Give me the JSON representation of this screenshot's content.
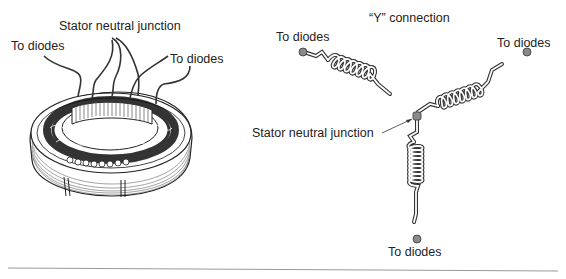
{
  "left_figure": {
    "name": "stator-assembly",
    "labels": {
      "neutral": "Stator neutral junction",
      "diodes_left": "To diodes",
      "diodes_right": "To diodes"
    }
  },
  "right_figure": {
    "name": "y-connection-schematic",
    "title": "“Y” connection",
    "labels": {
      "diodes_top_left": "To diodes",
      "diodes_top_right": "To diodes",
      "diodes_bottom": "To diodes",
      "neutral": "Stator neutral junction"
    }
  },
  "colors": {
    "line": "#333333",
    "terminal": "#8a8a8a",
    "coil_fill": "#ffffff",
    "rule": "#999999"
  }
}
